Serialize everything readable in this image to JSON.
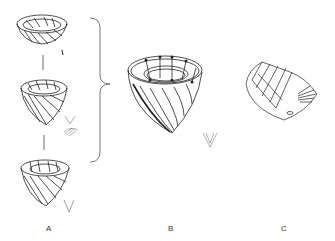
{
  "figure": {
    "panels": [
      {
        "id": "A",
        "label": "A",
        "description": "Three stacked cup-shaped specimens connected by lines, with small fan and V-shaped spicule details"
      },
      {
        "id": "B",
        "label": "B",
        "description": "Enlarged cup-shaped specimen with spiral bands and V-shaped spicule"
      },
      {
        "id": "C",
        "label": "C",
        "description": "Shell-like fan-shaped structure with radiating folds"
      }
    ],
    "colors": {
      "stroke": "#222222",
      "light_stroke": "#888888",
      "background": "#ffffff"
    }
  }
}
